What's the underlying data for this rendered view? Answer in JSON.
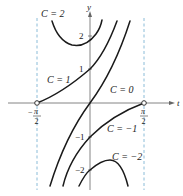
{
  "diagram": {
    "type": "family-of-solution-curves",
    "axes": {
      "horizontal_label": "t",
      "vertical_label": "y",
      "x_ticks": [
        {
          "value": "-π/2",
          "num": "π",
          "den": "2",
          "sign": "−"
        },
        {
          "value": "π/2",
          "num": "π",
          "den": "2",
          "sign": ""
        }
      ],
      "y_ticks": [
        "2",
        "1",
        "−1",
        "−2"
      ]
    },
    "asymptotes": [
      "t = -π/2",
      "t = π/2"
    ],
    "curves": [
      {
        "label": "C = 2",
        "C": 2
      },
      {
        "label": "C = 1",
        "C": 1
      },
      {
        "label": "C = 0",
        "C": 0
      },
      {
        "label": "C = −1",
        "C": -1
      },
      {
        "label": "C = −2",
        "C": -2
      }
    ],
    "colors": {
      "curve": "#1a1a1a",
      "axis": "#555555",
      "asymptote": "#7fb3d5"
    }
  }
}
